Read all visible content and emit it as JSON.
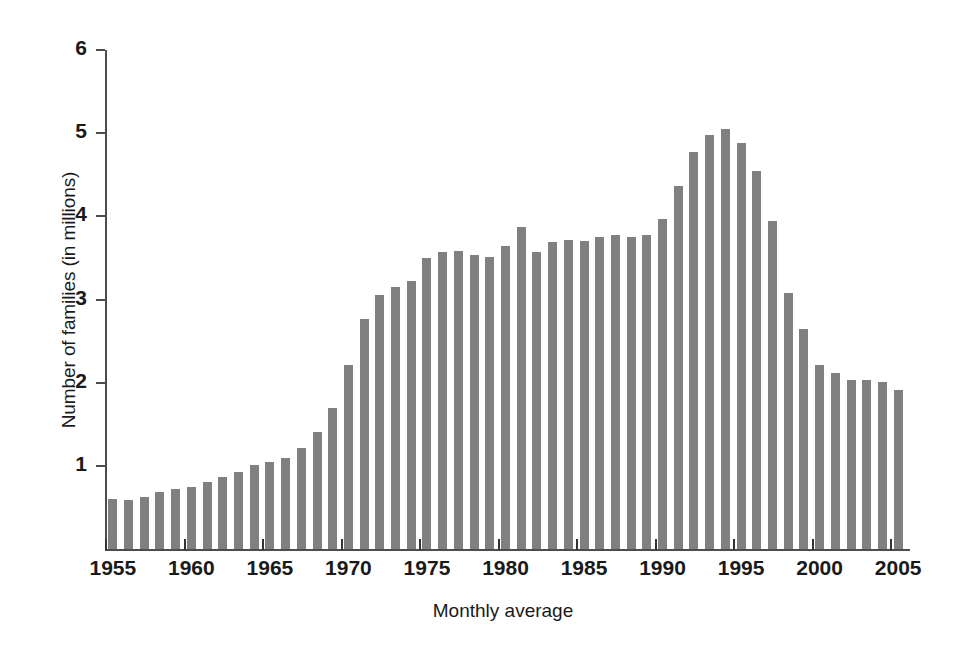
{
  "chart_data": {
    "type": "bar",
    "title": "",
    "subtitle": "",
    "xlabel": "Monthly average",
    "ylabel": "Number of families (in millions)",
    "ylim": [
      0,
      6
    ],
    "xlim": [
      1954.5,
      2005.5
    ],
    "grid": false,
    "legend": null,
    "bar_color": "#808080",
    "axis_color": "#4d4d4d",
    "y_ticks": [
      1,
      2,
      3,
      4,
      5,
      6
    ],
    "y_tick_labels": [
      "1",
      "2",
      "3",
      "4",
      "5",
      "6"
    ],
    "x_ticks": [
      1955,
      1960,
      1965,
      1970,
      1975,
      1980,
      1985,
      1990,
      1995,
      2000,
      2005
    ],
    "x_tick_labels": [
      "1955",
      "1960",
      "1965",
      "1970",
      "1975",
      "1980",
      "1985",
      "1990",
      "1995",
      "2000",
      "2005"
    ],
    "categories": [
      "1955",
      "1956",
      "1957",
      "1958",
      "1959",
      "1960",
      "1961",
      "1962",
      "1963",
      "1964",
      "1965",
      "1966",
      "1967",
      "1968",
      "1969",
      "1970",
      "1971",
      "1972",
      "1973",
      "1974",
      "1975",
      "1976",
      "1977",
      "1978",
      "1979",
      "1980",
      "1981",
      "1982",
      "1983",
      "1984",
      "1985",
      "1986",
      "1987",
      "1988",
      "1989",
      "1990",
      "1991",
      "1992",
      "1993",
      "1994",
      "1995",
      "1996",
      "1997",
      "1998",
      "1999",
      "2000",
      "2001",
      "2002",
      "2003",
      "2004",
      "2005"
    ],
    "values": [
      0.6,
      0.59,
      0.62,
      0.69,
      0.72,
      0.75,
      0.8,
      0.86,
      0.93,
      1.01,
      1.05,
      1.09,
      1.22,
      1.41,
      1.7,
      2.21,
      2.76,
      3.05,
      3.15,
      3.22,
      3.5,
      3.57,
      3.58,
      3.53,
      3.51,
      3.64,
      3.87,
      3.57,
      3.69,
      3.72,
      3.7,
      3.75,
      3.78,
      3.75,
      3.77,
      3.97,
      4.37,
      4.77,
      4.98,
      5.05,
      4.88,
      4.55,
      3.94,
      3.08,
      2.65,
      2.21,
      2.12,
      2.03,
      2.03,
      2.01,
      1.91
    ]
  },
  "axis": {
    "y_title": "Number of families (in millions)",
    "x_title": "Monthly average"
  }
}
